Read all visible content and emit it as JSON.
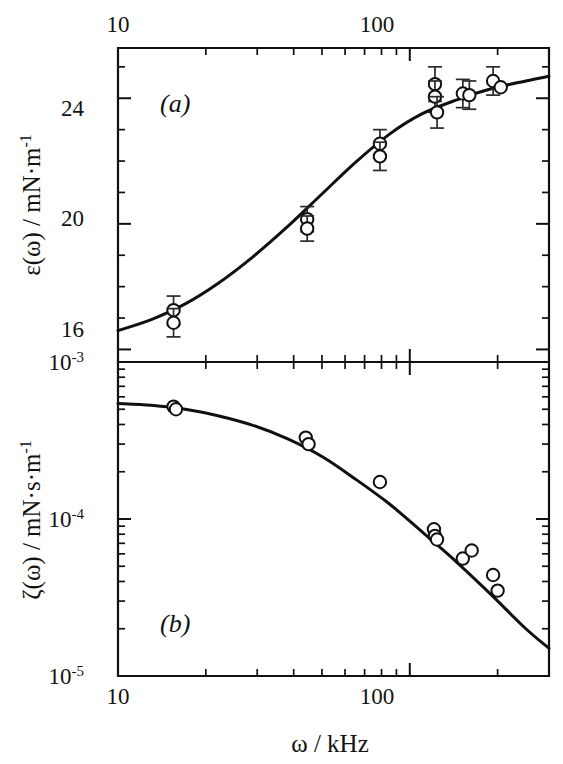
{
  "figure": {
    "xaxis_title": "ω / kHz",
    "panel_a_label": "(a)",
    "panel_b_label": "(b)"
  },
  "panel_a": {
    "ylabel_main": "ε(ω) / mN·m",
    "ylabel_exponent": "-1",
    "ytick_labels": [
      "24",
      "20",
      "16"
    ]
  },
  "panel_b": {
    "ylabel_main": "ζ(ω) / mN·s·m",
    "ylabel_exponent": "-1",
    "ytick_base": "10",
    "ytick_exponents": [
      "-3",
      "-4",
      "-5"
    ]
  },
  "xaxis": {
    "tick_labels_top": [
      "10",
      "100"
    ],
    "tick_labels_bottom": [
      "10",
      "100"
    ]
  },
  "chart_data": [
    {
      "type": "scatter",
      "panel": "a",
      "title": "(a) Dilational elasticity vs frequency",
      "xlabel": "ω / kHz",
      "ylabel": "ε(ω) / mN·m⁻¹",
      "xscale": "log",
      "yscale": "linear",
      "xlim": [
        10,
        300
      ],
      "ylim": [
        15.6,
        25.6
      ],
      "xticks": [
        10,
        100
      ],
      "yticks": [
        16,
        20,
        24
      ],
      "grid": false,
      "legend": null,
      "marker": "open-circle",
      "points": [
        {
          "x": 15.5,
          "y": 17.25,
          "yerr": 0.45
        },
        {
          "x": 15.5,
          "y": 16.85,
          "yerr": 0.45
        },
        {
          "x": 44.5,
          "y": 20.15,
          "yerr": 0.4
        },
        {
          "x": 44.5,
          "y": 19.85,
          "yerr": 0.4
        },
        {
          "x": 79.0,
          "y": 22.55,
          "yerr": 0.45
        },
        {
          "x": 79.0,
          "y": 22.15,
          "yerr": 0.45
        },
        {
          "x": 122.0,
          "y": 24.45,
          "yerr": 0.55
        },
        {
          "x": 122.0,
          "y": 24.05,
          "yerr": 0.5
        },
        {
          "x": 124.0,
          "y": 23.55,
          "yerr": 0.5
        },
        {
          "x": 152.0,
          "y": 24.15,
          "yerr": 0.45
        },
        {
          "x": 160.0,
          "y": 24.1,
          "yerr": 0.45
        },
        {
          "x": 193.0,
          "y": 24.55,
          "yerr": 0.45
        },
        {
          "x": 205.0,
          "y": 24.35,
          "yerr": 0.0
        }
      ],
      "model_curve": {
        "label": "fit",
        "x": [
          10,
          13,
          17,
          22,
          29,
          38,
          50,
          65,
          85,
          110,
          145,
          190,
          250,
          300
        ],
        "y": [
          16.6,
          16.95,
          17.45,
          18.1,
          18.95,
          19.9,
          20.95,
          21.95,
          22.85,
          23.5,
          23.95,
          24.3,
          24.55,
          24.7
        ]
      }
    },
    {
      "type": "scatter",
      "panel": "b",
      "title": "(b) Dilational viscosity vs frequency",
      "xlabel": "ω / kHz",
      "ylabel": "ζ(ω) / mN·s·m⁻¹",
      "xscale": "log",
      "yscale": "log",
      "xlim": [
        10,
        300
      ],
      "ylim": [
        1e-05,
        0.001
      ],
      "xticks": [
        10,
        100
      ],
      "yticks": [
        0.001,
        0.0001,
        1e-05
      ],
      "grid": false,
      "legend": null,
      "marker": "open-circle",
      "points": [
        {
          "x": 15.5,
          "y": 0.00052
        },
        {
          "x": 15.8,
          "y": 0.0005
        },
        {
          "x": 44.0,
          "y": 0.00033
        },
        {
          "x": 45.0,
          "y": 0.0003
        },
        {
          "x": 79.0,
          "y": 0.000172
        },
        {
          "x": 121.0,
          "y": 8.6e-05
        },
        {
          "x": 122.0,
          "y": 7.8e-05
        },
        {
          "x": 124.0,
          "y": 7.4e-05
        },
        {
          "x": 152.0,
          "y": 5.6e-05
        },
        {
          "x": 163.0,
          "y": 6.3e-05
        },
        {
          "x": 193.0,
          "y": 4.4e-05
        },
        {
          "x": 200.0,
          "y": 3.5e-05
        }
      ],
      "model_curve": {
        "label": "fit",
        "x": [
          10,
          13,
          17,
          22,
          29,
          38,
          50,
          65,
          85,
          110,
          145,
          190,
          250,
          300
        ],
        "y": [
          0.000545,
          0.00053,
          0.0005,
          0.000455,
          0.000395,
          0.000325,
          0.00025,
          0.00018,
          0.000125,
          8.3e-05,
          5.3e-05,
          3.3e-05,
          2e-05,
          1.5e-05
        ]
      }
    }
  ]
}
